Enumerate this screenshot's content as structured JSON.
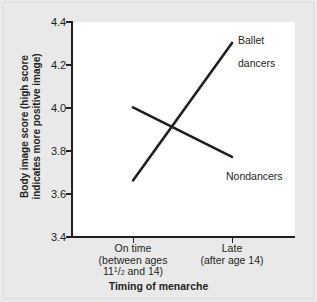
{
  "chart_data": {
    "type": "line",
    "title": "",
    "xlabel": "Timing of menarche",
    "ylabel": "Body image score (high score\nindicates more positive image)",
    "ylabel_line1": "Body image score (high score",
    "ylabel_line2": "indicates more positive image)",
    "categories": [
      "On time",
      "Late"
    ],
    "category_sublabels": [
      [
        "(between ages",
        "11½ and 14)"
      ],
      [
        "(after age 14)"
      ]
    ],
    "x_tick_labels": [
      {
        "main": "On time",
        "sub1": "(between ages",
        "sub2_pre": "11",
        "sub2_frac_num": "1",
        "sub2_frac_slash": "/",
        "sub2_frac_den": "2",
        "sub2_post": " and 14)"
      },
      {
        "main": "Late",
        "sub1": "(after age 14)",
        "sub2_pre": "",
        "sub2_frac_num": "",
        "sub2_frac_slash": "",
        "sub2_frac_den": "",
        "sub2_post": ""
      }
    ],
    "ylim": [
      3.4,
      4.4
    ],
    "y_ticks": [
      3.4,
      3.6,
      3.8,
      4.0,
      4.2,
      4.4
    ],
    "y_tick_labels": [
      "3.4",
      "3.6",
      "3.8",
      "4.0",
      "4.2",
      "4.4"
    ],
    "grid": false,
    "legend_position": "inline-right",
    "series": [
      {
        "name": "Ballet dancers",
        "label_line1": "Ballet",
        "label_line2": "dancers",
        "values": [
          3.66,
          4.3
        ],
        "color": "#231f20"
      },
      {
        "name": "Nondancers",
        "label_line1": "Nondancers",
        "label_line2": "",
        "values": [
          4.0,
          3.77
        ],
        "color": "#231f20"
      }
    ],
    "line_color": "#231f20",
    "plot_background": "#ffffff",
    "figure_background": "#e9e9e9"
  }
}
